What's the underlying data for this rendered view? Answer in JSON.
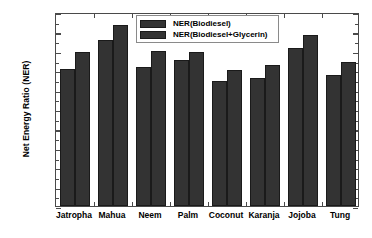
{
  "chart_data": {
    "type": "bar",
    "title": "",
    "xlabel": "",
    "ylabel": "Net Energy Ratio (NER)",
    "ylim": [
      0.0,
      2.0
    ],
    "ytick_step": 0.2,
    "grid": false,
    "legend_position": "top-center",
    "categories": [
      "Jatropha",
      "Mahua",
      "Neem",
      "Palm",
      "Coconut",
      "Karanja",
      "Jojoba",
      "Tung"
    ],
    "series": [
      {
        "name": "NER(Biodiesel)",
        "color": "#333333",
        "values": [
          1.41,
          1.71,
          1.43,
          1.51,
          1.29,
          1.32,
          1.63,
          1.35
        ]
      },
      {
        "name": "NER(Biodiesel+Glycerin)",
        "color": "#333333",
        "values": [
          1.59,
          1.87,
          1.6,
          1.59,
          1.4,
          1.45,
          1.76,
          1.48
        ]
      }
    ],
    "ytick_labels": [
      "0.0",
      "0.2",
      "0.4",
      "0.6",
      "0.8",
      "1.0",
      "1.2",
      "1.4",
      "1.6",
      "1.8",
      "2.0"
    ],
    "ytick_values": [
      0.0,
      0.2,
      0.4,
      0.6,
      0.8,
      1.0,
      1.2,
      1.4,
      1.6,
      1.8,
      2.0
    ]
  },
  "legend": {
    "items": [
      {
        "label": "NER(Biodiesel)"
      },
      {
        "label": "NER(Biodiesel+Glycerin)"
      }
    ]
  },
  "axes": {
    "y_title": "Net Energy Ratio (NER)"
  }
}
